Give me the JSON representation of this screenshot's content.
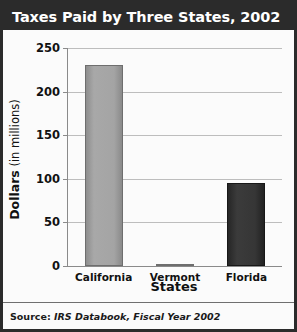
{
  "figure": {
    "title": "Taxes Paid by Three States, 2002",
    "source": "Source: IRS Databook, Fiscal Year 2002",
    "source_lead": "Source:",
    "source_rest": "IRS Databook, Fiscal Year 2002",
    "border_color": "#2b2b2b",
    "title_bg": "#2b2b2b",
    "title_fg": "#ffffff",
    "plot_bg": "#fbfbfb"
  },
  "chart_data": {
    "type": "bar",
    "title": "Taxes Paid by Three States, 2002",
    "subtitle": "",
    "categories": [
      "California",
      "Vermont",
      "Florida"
    ],
    "values": [
      230,
      2,
      95
    ],
    "series": [
      {
        "name": "Taxes paid",
        "values": [
          230,
          2,
          95
        ]
      }
    ],
    "xlabel": "States",
    "ylabel": "Dollars (in millions)",
    "ylabel_strong": "Dollars",
    "ylabel_rest": " (in millions)",
    "ylim": [
      0,
      250
    ],
    "yticks": [
      0,
      50,
      100,
      150,
      200,
      250
    ],
    "ytick_labels": [
      "0",
      "50",
      "100",
      "150",
      "200",
      "250"
    ],
    "grid": true,
    "grid_axis": "y",
    "legend": false,
    "legend_position": "none",
    "bar_colors": [
      "#a0a0a0",
      "#a0a0a0",
      "#333333"
    ],
    "annotations": []
  }
}
